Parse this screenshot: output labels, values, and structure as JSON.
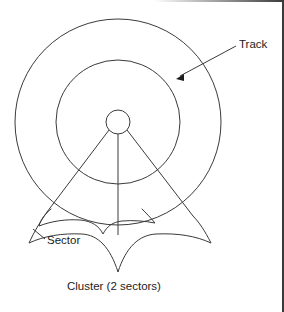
{
  "figure": {
    "background_color": "#ffffff",
    "line_color": "#3a3a3a",
    "text_color": "#1c1c1c",
    "width": 284,
    "height": 312
  },
  "labels": {
    "track": "Track",
    "sector": "Sector",
    "cluster": "Cluster (2 sectors)"
  },
  "geometry": {
    "center_x": 118,
    "center_y": 122,
    "outer_track_radius": 103,
    "inner_track_radius": 62,
    "hub_radius": 12,
    "radial_line_count": 3,
    "sector_count": 2,
    "cluster_tip_x": 118,
    "cluster_tip_y": 272
  },
  "annotations": {
    "track_arrow_target_x": 176,
    "track_arrow_target_y": 78,
    "track_leader_start_x": 236,
    "track_leader_start_y": 46,
    "sector_leader_start_x": 45,
    "sector_leader_start_y": 238,
    "sector_leader_end_x": 33,
    "sector_leader_end_y": 228
  },
  "icons": {
    "arrowhead": "arrowhead-icon",
    "track_circle": "circle-outline-icon",
    "hub_circle": "circle-outline-icon",
    "sector_brace": "curly-brace-icon",
    "cluster_brace": "curly-brace-icon"
  }
}
